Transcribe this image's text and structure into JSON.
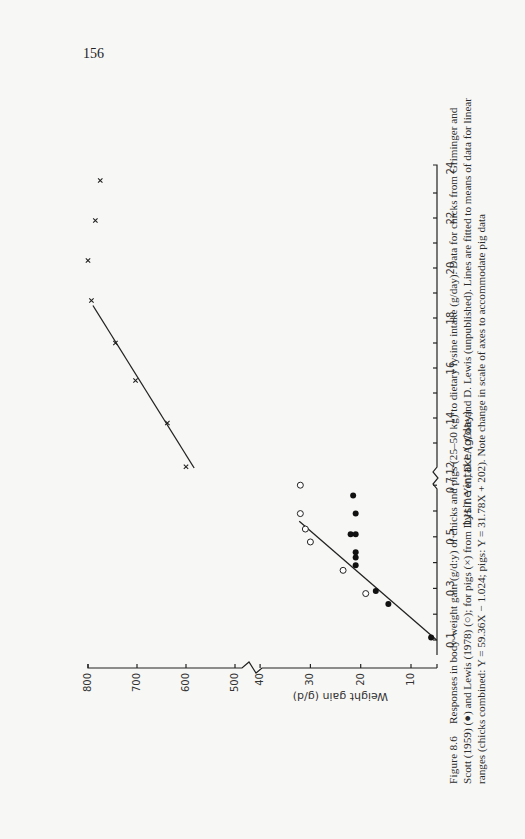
{
  "page": {
    "number": "156"
  },
  "caption": {
    "label": "Figure 8.6",
    "lines": [
      "Responses in body-weight gain (g/d:y) of chicks and pigs (25–50 kg) to dietary lysine intake (g/day). Data for chicks from Griminger and",
      "Scott (1959) (●) and Lewis (1978) (○); for pigs (×) from D.H.T. Yen, D.J.A. Cole and D. Lewis (unpublished). Lines are fitted to means of data for linear",
      "ranges (chicks combined: Y = 59.36X − 1.024; pigs: Y = 31.78X + 202). Note change in scale of axes to accommodate pig data"
    ]
  },
  "chart_data": {
    "type": "scatter",
    "xlabel": "Lysine intake (g/day)",
    "ylabel": "Weight gain (g/d)",
    "orientation": "rotated 90° counter-clockwise on page",
    "axis_break_x": {
      "low_segment": [
        0.1,
        0.7
      ],
      "high_segment": [
        12,
        24
      ]
    },
    "axis_break_y": {
      "low_segment": [
        5,
        40
      ],
      "high_segment": [
        500,
        800
      ]
    },
    "x_ticks_low": [
      "0.1",
      "0.3",
      "0.5",
      "0.7"
    ],
    "x_ticks_high": [
      "12",
      "14",
      "16",
      "18",
      "20",
      "22",
      "24"
    ],
    "y_ticks_low": [
      "10",
      "20",
      "30",
      "40"
    ],
    "y_ticks_high": [
      "500",
      "600",
      "700",
      "800"
    ],
    "grid": false,
    "legend": [
      {
        "symbol": "filled-circle",
        "label": "Chicks, Griminger and Scott (1959)"
      },
      {
        "symbol": "open-circle",
        "label": "Chicks, Lewis (1978)"
      },
      {
        "symbol": "cross",
        "label": "Pigs, D.H.T. Yen, D.J.A. Cole and D. Lewis (unpublished)"
      }
    ],
    "series": [
      {
        "name": "Chicks – Griminger and Scott (1959)",
        "marker": "filled-circle",
        "x": [
          0.11,
          0.24,
          0.29,
          0.39,
          0.42,
          0.44,
          0.51,
          0.51,
          0.59,
          0.66
        ],
        "y": [
          6,
          14.5,
          17,
          21,
          21,
          21,
          22,
          21,
          21,
          21.5
        ]
      },
      {
        "name": "Chicks – Lewis (1978)",
        "marker": "open-circle",
        "x": [
          0.28,
          0.37,
          0.48,
          0.53,
          0.59,
          0.7
        ],
        "y": [
          19,
          23.5,
          30,
          31,
          32,
          32
        ]
      },
      {
        "name": "Pigs",
        "marker": "cross",
        "x": [
          12.05,
          13.8,
          15.5,
          17.0,
          18.7,
          20.3,
          21.9,
          23.5
        ],
        "y": [
          600,
          638,
          703,
          744,
          793,
          800,
          785,
          775
        ]
      }
    ],
    "fitted_lines": [
      {
        "name": "Chicks combined",
        "equation": "Y = 59.36X − 1.024",
        "x_range": [
          0.1,
          0.56
        ]
      },
      {
        "name": "Pigs",
        "equation": "Y = 31.78X + 202",
        "x_range": [
          12,
          18.5
        ]
      }
    ]
  }
}
